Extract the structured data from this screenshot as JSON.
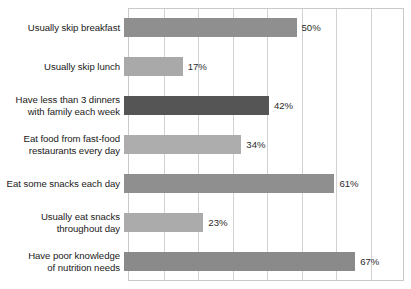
{
  "chart_data": {
    "type": "bar",
    "orientation": "horizontal",
    "title": "",
    "subtitle": "",
    "xlabel": "",
    "ylabel": "",
    "xlim": [
      0,
      80
    ],
    "grid": true,
    "gridlines_x": [
      0,
      10,
      20,
      30,
      40,
      50,
      60,
      70,
      80
    ],
    "legend": false,
    "value_suffix": "%",
    "categories": [
      "Usually skip breakfast",
      "Usually skip lunch",
      "Have less than 3 dinners\nwith family each week",
      "Eat food from fast-food\nrestaurants every day",
      "Eat some snacks each day",
      "Usually eat snacks\nthroughout day",
      "Have poor knowledge\nof nutrition needs"
    ],
    "values": [
      50,
      17,
      42,
      34,
      61,
      23,
      67
    ],
    "value_labels": [
      "50%",
      "17%",
      "42%",
      "34%",
      "61%",
      "23%",
      "67%"
    ],
    "bar_colors": [
      "#8f8f8f",
      "#a9a9a9",
      "#555555",
      "#adadad",
      "#8f8f8f",
      "#ababab",
      "#8a8a8a"
    ]
  },
  "colors": {
    "background": "#ffffff",
    "plot_border": "#c9c9c9",
    "gridline": "#d2d2d2",
    "label_text": "#1a1a1a",
    "value_text": "#2b2b2b"
  }
}
